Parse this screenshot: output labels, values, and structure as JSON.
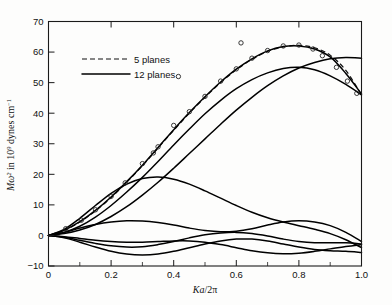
{
  "figure": {
    "background": "#fdfdfc",
    "frame_color": "#1a1a1a",
    "curve_color": "#000000"
  },
  "legend": {
    "entries": [
      {
        "label": "5 planes",
        "style": "dashed"
      },
      {
        "label": "12 planes",
        "style": "solid"
      }
    ]
  },
  "axis": {
    "xlabel_K": "K",
    "xlabel_a": "a",
    "xlabel_rest": "/2π",
    "ylabel_M": "M",
    "ylabel_omega": "ω",
    "ylabel_omega_sup": "2",
    "ylabel_mid": " in 10",
    "ylabel_exp": "9",
    "ylabel_tail": " dynes cm",
    "ylabel_tail_sup": "−1",
    "xticklabels": [
      "0",
      "0.2",
      "0.4",
      "0.6",
      "0.8",
      "1.0"
    ],
    "yticklabels": [
      "−10",
      "0",
      "10",
      "20",
      "30",
      "40",
      "50",
      "60",
      "70"
    ]
  },
  "chart_data": {
    "type": "line",
    "title": "",
    "xlabel": "Ka/2π",
    "ylabel": "Mω² in 10⁹ dynes cm⁻¹",
    "xlim": [
      0,
      1.0
    ],
    "ylim": [
      -10,
      70
    ],
    "xticks": [
      0,
      0.2,
      0.4,
      0.6,
      0.8,
      1.0
    ],
    "xminorticks": [
      0.1,
      0.3,
      0.5,
      0.7,
      0.9
    ],
    "yticks": [
      -10,
      0,
      10,
      20,
      30,
      40,
      50,
      60,
      70
    ],
    "grid": false,
    "legend_position": "upper-left",
    "x": [
      0,
      0.05,
      0.1,
      0.15,
      0.2,
      0.25,
      0.3,
      0.35,
      0.4,
      0.45,
      0.5,
      0.55,
      0.6,
      0.65,
      0.7,
      0.75,
      0.8,
      0.85,
      0.9,
      0.95,
      1.0
    ],
    "series": [
      {
        "name": "5 planes - top branch",
        "style": "dashed",
        "values": [
          0,
          1.6,
          4.4,
          8.0,
          12.4,
          17.4,
          22.8,
          28.6,
          34.4,
          40.0,
          45.2,
          50.0,
          54.2,
          57.6,
          60.2,
          61.7,
          62.2,
          61.4,
          59.0,
          54.0,
          46.0
        ]
      },
      {
        "name": "12 planes - top branch",
        "style": "solid",
        "values": [
          0,
          1.7,
          4.5,
          8.2,
          12.6,
          17.6,
          23.0,
          28.8,
          34.6,
          40.2,
          45.4,
          50.2,
          54.4,
          57.8,
          60.4,
          61.8,
          62.0,
          61.0,
          58.4,
          53.0,
          46.3
        ]
      },
      {
        "name": "12 planes - second branch",
        "style": "solid",
        "values": [
          0,
          0.6,
          1.8,
          3.6,
          6.2,
          9.4,
          13.2,
          17.4,
          22.0,
          26.8,
          31.6,
          36.4,
          41.0,
          45.2,
          49.0,
          52.2,
          54.8,
          56.6,
          57.8,
          58.2,
          58.0
        ]
      },
      {
        "name": "12 planes - third branch",
        "style": "solid",
        "values": [
          0,
          1.0,
          3.0,
          6.0,
          9.8,
          14.2,
          19.0,
          24.2,
          29.6,
          34.8,
          39.8,
          44.2,
          48.0,
          51.0,
          53.2,
          54.6,
          55.0,
          54.2,
          52.2,
          49.4,
          46.0
        ]
      },
      {
        "name": "12 planes - optical-like branch (peak 19)",
        "style": "solid",
        "values": [
          0,
          2.0,
          5.6,
          9.8,
          13.8,
          16.8,
          18.6,
          19.1,
          18.4,
          16.8,
          14.6,
          12.2,
          9.8,
          7.6,
          5.8,
          4.4,
          3.2,
          2.0,
          0.6,
          -1.4,
          -4.0
        ]
      },
      {
        "name": "12 planes - low branch A",
        "style": "solid",
        "values": [
          0,
          1.0,
          2.4,
          3.6,
          4.4,
          4.8,
          4.7,
          4.2,
          3.4,
          2.4,
          1.6,
          1.2,
          1.4,
          2.2,
          3.4,
          4.4,
          4.8,
          4.4,
          3.2,
          1.0,
          -2.0
        ]
      },
      {
        "name": "12 planes - low branch B",
        "style": "solid",
        "values": [
          0,
          -0.6,
          -1.6,
          -2.6,
          -3.4,
          -3.8,
          -3.7,
          -3.0,
          -2.0,
          -0.8,
          0.2,
          0.8,
          1.0,
          0.6,
          -0.2,
          -1.2,
          -2.0,
          -2.4,
          -2.4,
          -2.4,
          -2.8
        ]
      },
      {
        "name": "12 planes - low branch C",
        "style": "solid",
        "values": [
          0,
          -0.8,
          -2.2,
          -3.8,
          -5.2,
          -6.1,
          -6.4,
          -6.1,
          -5.2,
          -4.0,
          -2.8,
          -1.8,
          -1.2,
          -1.2,
          -1.8,
          -2.8,
          -3.8,
          -4.6,
          -5.0,
          -5.2,
          -5.6
        ]
      },
      {
        "name": "12 planes - low branch D",
        "style": "solid",
        "values": [
          0,
          -0.4,
          -1.0,
          -1.6,
          -2.0,
          -2.2,
          -2.2,
          -2.0,
          -1.8,
          -1.8,
          -2.2,
          -3.0,
          -4.0,
          -5.0,
          -5.7,
          -6.0,
          -5.8,
          -5.2,
          -4.4,
          -3.6,
          -3.0
        ]
      }
    ],
    "scatter": {
      "name": "experimental points",
      "marker": "open-circle",
      "points": [
        {
          "x": 0.055,
          "y": 2.2
        },
        {
          "x": 0.105,
          "y": 5.0
        },
        {
          "x": 0.15,
          "y": 8.4
        },
        {
          "x": 0.2,
          "y": 12.8
        },
        {
          "x": 0.245,
          "y": 17.2
        },
        {
          "x": 0.3,
          "y": 23.5
        },
        {
          "x": 0.335,
          "y": 27.0
        },
        {
          "x": 0.35,
          "y": 29.0
        },
        {
          "x": 0.4,
          "y": 36.0
        },
        {
          "x": 0.415,
          "y": 52.0
        },
        {
          "x": 0.45,
          "y": 40.5
        },
        {
          "x": 0.5,
          "y": 45.5
        },
        {
          "x": 0.55,
          "y": 50.5
        },
        {
          "x": 0.6,
          "y": 54.5
        },
        {
          "x": 0.615,
          "y": 63.0
        },
        {
          "x": 0.65,
          "y": 58.0
        },
        {
          "x": 0.7,
          "y": 60.5
        },
        {
          "x": 0.75,
          "y": 62.0
        },
        {
          "x": 0.8,
          "y": 62.3
        },
        {
          "x": 0.845,
          "y": 61.0
        },
        {
          "x": 0.875,
          "y": 58.8
        },
        {
          "x": 0.92,
          "y": 55.0
        },
        {
          "x": 0.955,
          "y": 50.5
        },
        {
          "x": 0.985,
          "y": 46.5
        }
      ]
    }
  }
}
